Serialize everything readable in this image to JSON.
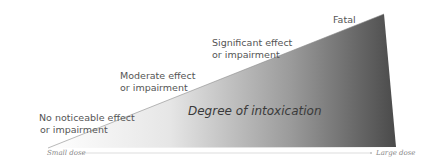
{
  "diagram": {
    "center_label": "Degree of intoxication",
    "levels": [
      {
        "line1": "No noticeable effect",
        "line2": "or impairment"
      },
      {
        "line1": "Moderate effect",
        "line2": "or impairment"
      },
      {
        "line1": "Significant effect",
        "line2": "or impairment"
      },
      {
        "line1": "Fatal",
        "line2": ""
      }
    ],
    "axis": {
      "start_label": "Small dose",
      "end_label": "Large dose"
    },
    "colors": {
      "gradient_start": "#ffffff",
      "gradient_end": "#4a4a4a",
      "axis_line": "#dddddd"
    }
  }
}
